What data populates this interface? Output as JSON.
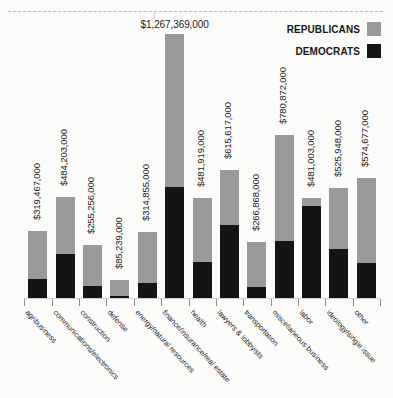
{
  "legend": {
    "items": [
      {
        "label": "REPUBLICANS",
        "color": "#9a9a9a",
        "key": "republicans"
      },
      {
        "label": "DEMOCRATS",
        "color": "#141414",
        "key": "democrats"
      }
    ]
  },
  "chart_data": {
    "type": "bar",
    "subtype": "stacked-bar",
    "title": "",
    "xlabel": "",
    "ylabel": "",
    "grid": false,
    "legend_position": "top-right",
    "ylim": [
      0,
      1267369000
    ],
    "categories": [
      "agribusiness",
      "communications/electronics",
      "construction",
      "defense",
      "energy/natural resources",
      "finance/insurance/real estate",
      "health",
      "lawyers & lobbyists",
      "transportation",
      "miscellaneous business",
      "labor",
      "ideology/single issue",
      "other"
    ],
    "totals": [
      319467000,
      484203000,
      255256000,
      85239000,
      314855000,
      1267369000,
      481919000,
      615617000,
      266868000,
      780872000,
      481003000,
      525948000,
      574677000
    ],
    "total_labels": [
      "$319,467,000",
      "$484,203,000",
      "$255,256,000",
      "$85,239,000",
      "$314,855,000",
      "$1,267,369,000",
      "$481,919,000",
      "$615,617,000",
      "$266,868,000",
      "$780,872,000",
      "$481,003,000",
      "$525,948,000",
      "$574,677,000"
    ],
    "series": [
      {
        "name": "DEMOCRATS",
        "color": "#141414",
        "values": [
          92000000,
          213000000,
          59000000,
          10000000,
          72000000,
          535000000,
          175000000,
          350000000,
          52000000,
          273000000,
          440000000,
          235000000,
          167000000
        ]
      },
      {
        "name": "REPUBLICANS",
        "color": "#9a9a9a",
        "values": [
          227467000,
          271203000,
          196256000,
          75239000,
          242855000,
          732369000,
          306919000,
          265617000,
          214868000,
          507872000,
          41003000,
          290948000,
          407677000
        ]
      }
    ]
  }
}
